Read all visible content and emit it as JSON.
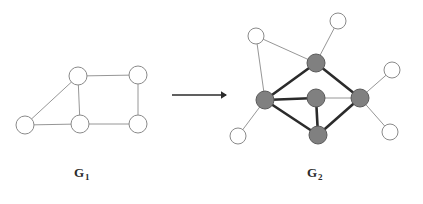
{
  "figure": {
    "title": "",
    "colors": {
      "background": "#ffffff",
      "edge_thin": "#8a8a8a",
      "edge_thick": "#2b2b2b",
      "node_white_fill": "#ffffff",
      "node_white_stroke": "#8a8a8a",
      "node_gray_fill": "#808080",
      "node_gray_stroke": "#5a5a5a",
      "arrow": "#2b2b2b",
      "label_text": "#2b2b2b"
    },
    "arrow": {
      "name": "transformation-arrow",
      "x1": 172,
      "y1": 95,
      "x2": 227,
      "y2": 95,
      "head_size": 6
    },
    "labels": [
      {
        "id": "g1",
        "base": "G",
        "sub": "1",
        "x": 74,
        "y": 165
      },
      {
        "id": "g2",
        "base": "G",
        "sub": "2",
        "x": 307,
        "y": 165
      }
    ],
    "graphs": [
      {
        "id": "G1",
        "label": "G1",
        "node_radius": 9,
        "nodes": [
          {
            "id": "a",
            "x": 25,
            "y": 125,
            "fill": "white"
          },
          {
            "id": "b",
            "x": 78,
            "y": 76,
            "fill": "white"
          },
          {
            "id": "c",
            "x": 138,
            "y": 75,
            "fill": "white"
          },
          {
            "id": "d",
            "x": 80,
            "y": 124,
            "fill": "white"
          },
          {
            "id": "e",
            "x": 138,
            "y": 124,
            "fill": "white"
          }
        ],
        "edges": [
          {
            "from": "a",
            "to": "b",
            "weight": "thin"
          },
          {
            "from": "a",
            "to": "d",
            "weight": "thin"
          },
          {
            "from": "b",
            "to": "c",
            "weight": "thin"
          },
          {
            "from": "b",
            "to": "d",
            "weight": "thin"
          },
          {
            "from": "c",
            "to": "e",
            "weight": "thin"
          },
          {
            "from": "d",
            "to": "e",
            "weight": "thin"
          }
        ]
      },
      {
        "id": "G2",
        "label": "G2",
        "node_radius_gray": 9,
        "node_radius_white": 8,
        "nodes": [
          {
            "id": "gt",
            "x": 316,
            "y": 63,
            "fill": "gray"
          },
          {
            "id": "gl",
            "x": 265,
            "y": 100,
            "fill": "gray"
          },
          {
            "id": "gc",
            "x": 316,
            "y": 98,
            "fill": "gray"
          },
          {
            "id": "gr",
            "x": 360,
            "y": 98,
            "fill": "gray"
          },
          {
            "id": "gb",
            "x": 318,
            "y": 135,
            "fill": "gray"
          },
          {
            "id": "w1",
            "x": 256,
            "y": 36,
            "fill": "white"
          },
          {
            "id": "w2",
            "x": 338,
            "y": 21,
            "fill": "white"
          },
          {
            "id": "w3",
            "x": 392,
            "y": 70,
            "fill": "white"
          },
          {
            "id": "w4",
            "x": 390,
            "y": 132,
            "fill": "white"
          },
          {
            "id": "w5",
            "x": 238,
            "y": 136,
            "fill": "white"
          }
        ],
        "edges": [
          {
            "from": "gt",
            "to": "gl",
            "weight": "thick"
          },
          {
            "from": "gt",
            "to": "gr",
            "weight": "thick"
          },
          {
            "from": "gl",
            "to": "gc",
            "weight": "thick"
          },
          {
            "from": "gl",
            "to": "gb",
            "weight": "thick"
          },
          {
            "from": "gc",
            "to": "gb",
            "weight": "thick"
          },
          {
            "from": "gb",
            "to": "gr",
            "weight": "thick"
          },
          {
            "from": "gc",
            "to": "gr",
            "weight": "thin"
          },
          {
            "from": "w1",
            "to": "gt",
            "weight": "thin"
          },
          {
            "from": "w1",
            "to": "gl",
            "weight": "thin"
          },
          {
            "from": "w2",
            "to": "gt",
            "weight": "thin"
          },
          {
            "from": "w3",
            "to": "gr",
            "weight": "thin"
          },
          {
            "from": "w4",
            "to": "gr",
            "weight": "thin"
          },
          {
            "from": "w5",
            "to": "gl",
            "weight": "thin"
          }
        ]
      }
    ]
  }
}
